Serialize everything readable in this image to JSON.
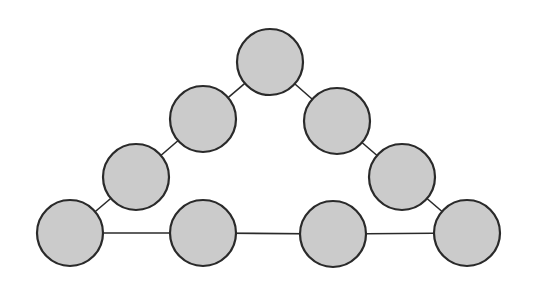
{
  "diagram": {
    "type": "graph",
    "shape": "triangle-chain",
    "colors": {
      "background": "#ffffff",
      "node_fill": "#cbcbcb",
      "node_stroke": "#2a2a2a",
      "edge": "#2a2a2a"
    },
    "node_radius": 33,
    "nodes": [
      {
        "id": "top",
        "x": 270,
        "y": 62
      },
      {
        "id": "left-2",
        "x": 203,
        "y": 119
      },
      {
        "id": "left-3",
        "x": 136,
        "y": 177
      },
      {
        "id": "bottom-left",
        "x": 70,
        "y": 233
      },
      {
        "id": "bottom-2",
        "x": 203,
        "y": 233
      },
      {
        "id": "bottom-3",
        "x": 333,
        "y": 234
      },
      {
        "id": "bottom-right",
        "x": 467,
        "y": 233
      },
      {
        "id": "right-3",
        "x": 402,
        "y": 177
      },
      {
        "id": "right-2",
        "x": 337,
        "y": 121
      }
    ],
    "edges": [
      [
        "top",
        "left-2"
      ],
      [
        "left-2",
        "left-3"
      ],
      [
        "left-3",
        "bottom-left"
      ],
      [
        "bottom-left",
        "bottom-2"
      ],
      [
        "bottom-2",
        "bottom-3"
      ],
      [
        "bottom-3",
        "bottom-right"
      ],
      [
        "bottom-right",
        "right-3"
      ],
      [
        "right-3",
        "right-2"
      ],
      [
        "right-2",
        "top"
      ]
    ]
  }
}
